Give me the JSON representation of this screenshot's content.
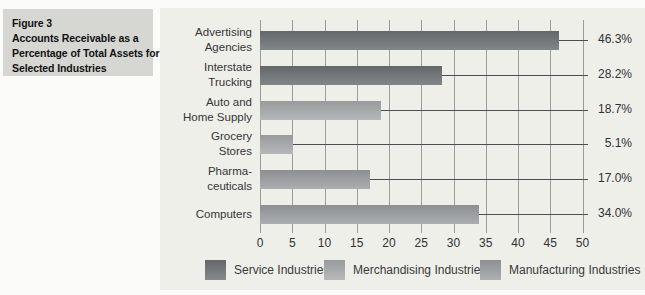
{
  "figure_caption": {
    "lines": [
      "Figure 3",
      "Accounts Receivable as a",
      "Percentage of Total Assets for",
      "Selected Industries"
    ]
  },
  "chart_data": {
    "type": "bar",
    "orientation": "horizontal",
    "title": "Accounts Receivable as a Percentage of Total Assets for Selected Industries",
    "categories": [
      [
        "Advertising",
        "Agencies"
      ],
      [
        "Interstate",
        "Trucking"
      ],
      [
        "Auto and",
        "Home Supply"
      ],
      [
        "Grocery",
        "Stores"
      ],
      [
        "Pharma-",
        "ceuticals"
      ],
      [
        "Computers"
      ]
    ],
    "values": [
      46.3,
      28.2,
      18.7,
      5.1,
      17.0,
      34.0
    ],
    "value_labels": [
      "46.3%",
      "28.2%",
      "18.7%",
      "5.1%",
      "17.0%",
      "34.0%"
    ],
    "bar_series": [
      "service",
      "service",
      "merchandising",
      "merchandising",
      "manufacturing",
      "manufacturing"
    ],
    "series_colors": {
      "service": "#6f7376",
      "merchandising": "#a9acae",
      "manufacturing": "#9da0a3"
    },
    "xlim": [
      0,
      50
    ],
    "xticks": [
      0,
      5,
      10,
      15,
      20,
      25,
      30,
      35,
      40,
      45,
      50
    ],
    "grid": true,
    "legend_position": "bottom",
    "legend": [
      {
        "label": "Service Industries",
        "series": "service"
      },
      {
        "label": "Merchandising Industries",
        "series": "merchandising"
      },
      {
        "label": "Manufacturing Industries",
        "series": "manufacturing"
      }
    ]
  }
}
